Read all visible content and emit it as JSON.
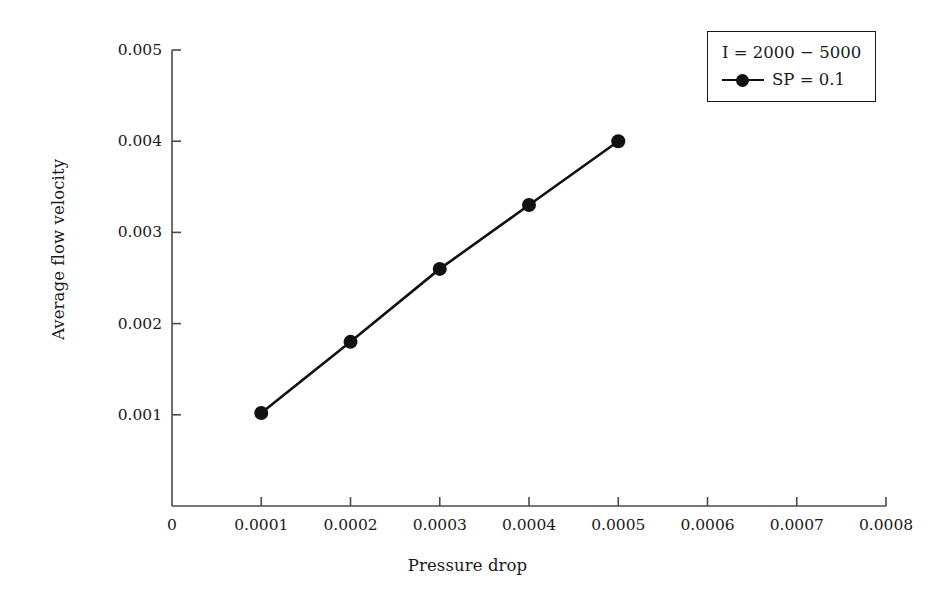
{
  "chart_data": {
    "type": "line",
    "title": "",
    "xlabel": "Pressure drop",
    "ylabel": "Average flow velocity",
    "xlim": [
      0,
      0.0008
    ],
    "ylim": [
      0,
      0.005
    ],
    "grid": false,
    "legend_position": "top-right",
    "legend_title": "I = 2000 − 5000",
    "xticks": [
      0,
      0.0001,
      0.0002,
      0.0003,
      0.0004,
      0.0005,
      0.0006,
      0.0007,
      0.0008
    ],
    "xtick_labels": [
      "0",
      "0.0001",
      "0.0002",
      "0.0003",
      "0.0004",
      "0.0005",
      "0.0006",
      "0.0007",
      "0.0008"
    ],
    "yticks": [
      0.001,
      0.002,
      0.003,
      0.004,
      0.005
    ],
    "ytick_labels": [
      "0.001",
      "0.002",
      "0.003",
      "0.004",
      "0.005"
    ],
    "series": [
      {
        "name": "SP = 0.1",
        "color": "#111111",
        "marker": "circle",
        "x": [
          0.0001,
          0.0002,
          0.0003,
          0.0004,
          0.0005
        ],
        "values": [
          0.00102,
          0.0018,
          0.0026,
          0.0033,
          0.004
        ]
      }
    ]
  },
  "legend": {
    "title": "I = 2000 − 5000",
    "entries": [
      {
        "label": "SP = 0.1"
      }
    ]
  },
  "axes": {
    "x_title": "Pressure drop",
    "y_title": "Average flow velocity"
  }
}
